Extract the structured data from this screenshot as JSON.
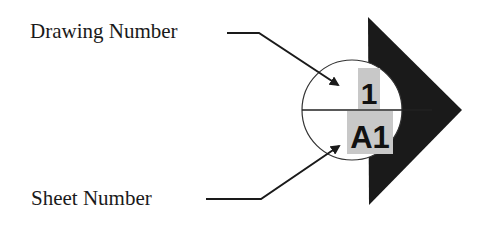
{
  "diagram": {
    "type": "section-marker-callout",
    "labels": {
      "drawing_number_label": "Drawing Number",
      "sheet_number_label": "Sheet Number"
    },
    "symbol": {
      "drawing_number": "1",
      "sheet_number": "A1",
      "highlight_color": "#c8c8c8",
      "triangle_color": "#1a1a1a",
      "circle_stroke": "#333333"
    }
  }
}
